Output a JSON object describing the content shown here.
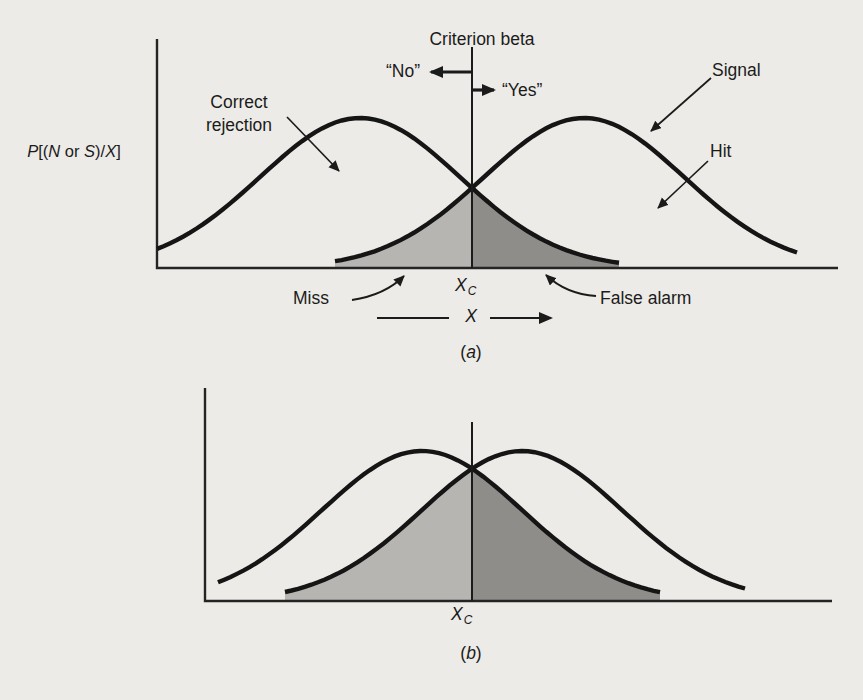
{
  "figure": {
    "background_color": "#edebe7",
    "ink_color": "#1b1b1b",
    "panel_a": {
      "criterion_title": "Criterion beta",
      "no_label": "“No”",
      "yes_label": "“Yes”",
      "signal_label": "Signal",
      "hit_label": "Hit",
      "correct_rejection_line1": "Correct",
      "correct_rejection_line2": "rejection",
      "miss_label": "Miss",
      "false_alarm_label": "False alarm",
      "y_axis_label_parts": {
        "p": "P",
        "b1": "[(",
        "n": "N",
        "or": " or ",
        "s": "S",
        "b2": ")/",
        "x": "X",
        "b3": "]"
      },
      "x_axis_label": "X",
      "criterion_tick": {
        "base": "X",
        "sub": "C"
      },
      "caption": {
        "open": "(",
        "letter": "a",
        "close": ")"
      }
    },
    "panel_b": {
      "criterion_tick": {
        "base": "X",
        "sub": "C"
      },
      "caption": {
        "open": "(",
        "letter": "b",
        "close": ")"
      }
    }
  },
  "chart_data": [
    {
      "panel": "a",
      "type": "area",
      "title": "(a)",
      "xlabel": "X",
      "ylabel": "P[(N or S)/X]",
      "criterion_x": 0,
      "criterion_label": "Xc",
      "curves": [
        {
          "name": "noise",
          "mean": -1.12,
          "sd": 1,
          "peak": 1,
          "draw_range": [
            -2.03,
            2.59
          ]
        },
        {
          "name": "signal",
          "mean": 1.12,
          "sd": 1,
          "peak": 1,
          "draw_range": [
            -2.49,
            2.13
          ]
        }
      ],
      "shaded_regions": [
        {
          "label": "Miss",
          "curve": "signal",
          "side": "left",
          "color": "#b6b5b2"
        },
        {
          "label": "False alarm",
          "curve": "noise",
          "side": "right",
          "color": "#8e8d8a"
        }
      ],
      "response_regions": {
        "left_of_criterion": "“No”",
        "right_of_criterion": "“Yes”"
      },
      "annotations": [
        "Criterion beta",
        "Signal",
        "Hit",
        "Correct rejection",
        "Miss",
        "False alarm"
      ]
    },
    {
      "panel": "b",
      "type": "area",
      "title": "(b)",
      "xlabel": "",
      "ylabel": "",
      "criterion_x": 0,
      "criterion_label": "Xc",
      "curves": [
        {
          "name": "noise",
          "mean": -0.5,
          "sd": 1,
          "peak": 1,
          "draw_range": [
            -2.04,
            2.38
          ]
        },
        {
          "name": "signal",
          "mean": 0.5,
          "sd": 1,
          "peak": 1,
          "draw_range": [
            -2.37,
            2.23
          ]
        }
      ],
      "shaded_regions": [
        {
          "label": "miss-area",
          "curve": "signal",
          "side": "left",
          "color": "#b6b5b2"
        },
        {
          "label": "false-alarm-area",
          "curve": "noise",
          "side": "right",
          "color": "#8e8d8a"
        }
      ]
    }
  ]
}
